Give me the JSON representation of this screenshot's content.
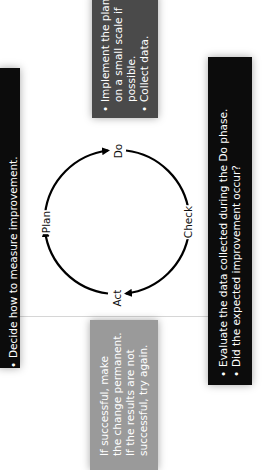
{
  "diagram": {
    "orientation": "rotated -90deg",
    "stages": {
      "plan": {
        "label": "Plan"
      },
      "do": {
        "label": "Do"
      },
      "check": {
        "label": "Check"
      },
      "act": {
        "label": "Act"
      }
    },
    "boxes": {
      "plan": {
        "color": "#0c0c0c",
        "bullets": [
          "Decide how to measure improvement."
        ]
      },
      "do": {
        "color": "#4a4a4a",
        "bullets": [
          {
            "lines": [
              "Implement the plan",
              "on a small scale if",
              "possible."
            ]
          },
          {
            "lines": [
              "Collect data."
            ]
          }
        ]
      },
      "check": {
        "color": "#0c0c0c",
        "bullets": [
          "Evaluate the data collected during the Do phase.",
          "Did the expected improvement occur?"
        ]
      },
      "act": {
        "color": "#9a9a9a",
        "lines": [
          "If successful, make",
          "the change permanent.",
          "If the results are not",
          "successful, try again."
        ]
      }
    }
  }
}
